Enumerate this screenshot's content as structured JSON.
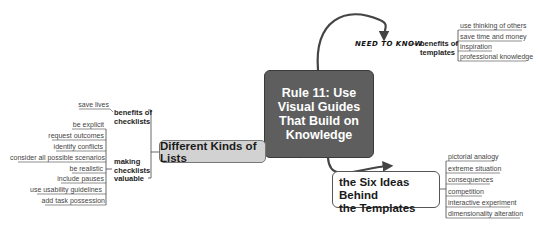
{
  "central_topic": "Rule 11: Use Visual Guides That Build on Knowledge",
  "branches": {
    "top_right": {
      "annotation": "NEED TO KNOW",
      "label": "benefits of templates",
      "label_lines": [
        "benefits of",
        "templates"
      ],
      "leaves": [
        "use thinking of others",
        "save time and money",
        "inspiration",
        "professional knowledge"
      ]
    },
    "left": {
      "label": "Different Kinds of Lists",
      "groups": [
        {
          "label": "benefits of checklists",
          "label_lines": [
            "benefits of",
            "checklists"
          ],
          "leaves": [
            "save lives"
          ]
        },
        {
          "label": "making checklists valuable",
          "label_lines": [
            "making",
            "checklists",
            "valuable"
          ],
          "leaves": [
            "be explicit",
            "request outcomes",
            "identify conflicts",
            "consider all possible scenarios",
            "be realistic",
            "include pauses",
            "use usability guidelines",
            "add task possession"
          ]
        }
      ]
    },
    "bottom_right": {
      "label": "the Six Ideas Behind the Templates",
      "label_lines": [
        "the Six Ideas Behind",
        "the Templates"
      ],
      "leaves": [
        "pictorial analogy",
        "extreme situation",
        "consequences",
        "competition",
        "interactive experiment",
        "dimensionality alteration"
      ]
    }
  },
  "colors": {
    "central_fill": "#5e5e5e",
    "lists_fill": "#d2d2d2",
    "six_fill": "#ffffff",
    "connector": "#444444"
  }
}
